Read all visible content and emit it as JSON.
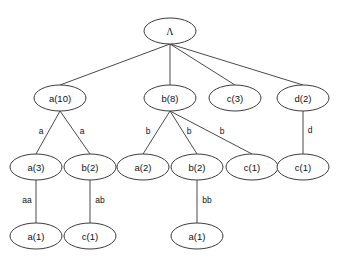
{
  "figure": {
    "type": "tree-diagram",
    "title": "",
    "background_color": "#ffffff",
    "node_fill": "#ffffff",
    "node_stroke": "#3c3c3c",
    "edge_stroke": "#4a4a4a",
    "text_color": "#111111"
  },
  "nodes": [
    {
      "id": "root",
      "label": "Λ",
      "cx": 170,
      "cy": 31,
      "rx": 26,
      "ry": 13,
      "level": 0
    },
    {
      "id": "n-a10",
      "label": "a(10)",
      "cx": 60,
      "cy": 98,
      "rx": 26,
      "ry": 13,
      "level": 1
    },
    {
      "id": "n-b8",
      "label": "b(8)",
      "cx": 170,
      "cy": 98,
      "rx": 26,
      "ry": 13,
      "level": 1
    },
    {
      "id": "n-c3",
      "label": "c(3)",
      "cx": 235,
      "cy": 98,
      "rx": 26,
      "ry": 13,
      "level": 1
    },
    {
      "id": "n-d2",
      "label": "d(2)",
      "cx": 303,
      "cy": 98,
      "rx": 26,
      "ry": 13,
      "level": 1
    },
    {
      "id": "n-a3",
      "label": "a(3)",
      "cx": 36,
      "cy": 167,
      "rx": 26,
      "ry": 13,
      "level": 2
    },
    {
      "id": "n-b2l",
      "label": "b(2)",
      "cx": 90,
      "cy": 167,
      "rx": 26,
      "ry": 13,
      "level": 2
    },
    {
      "id": "n-a2",
      "label": "a(2)",
      "cx": 143,
      "cy": 167,
      "rx": 26,
      "ry": 13,
      "level": 2
    },
    {
      "id": "n-b2m",
      "label": "b(2)",
      "cx": 197,
      "cy": 167,
      "rx": 26,
      "ry": 13,
      "level": 2
    },
    {
      "id": "n-c1m",
      "label": "c(1)",
      "cx": 252,
      "cy": 167,
      "rx": 26,
      "ry": 13,
      "level": 2
    },
    {
      "id": "n-c1r",
      "label": "c(1)",
      "cx": 303,
      "cy": 167,
      "rx": 26,
      "ry": 13,
      "level": 2
    },
    {
      "id": "n-a1l",
      "label": "a(1)",
      "cx": 36,
      "cy": 236,
      "rx": 26,
      "ry": 13,
      "level": 3
    },
    {
      "id": "n-c1l",
      "label": "c(1)",
      "cx": 90,
      "cy": 236,
      "rx": 26,
      "ry": 13,
      "level": 3
    },
    {
      "id": "n-a1m",
      "label": "a(1)",
      "cx": 197,
      "cy": 236,
      "rx": 26,
      "ry": 13,
      "level": 3
    }
  ],
  "edges": [
    {
      "id": "e-root-a10",
      "from": "root",
      "to": "n-a10",
      "x1": 170,
      "y1": 44,
      "x2": 60,
      "y2": 85,
      "label": "",
      "lx": 0,
      "ly": 0
    },
    {
      "id": "e-root-b8",
      "from": "root",
      "to": "n-b8",
      "x1": 170,
      "y1": 44,
      "x2": 170,
      "y2": 85,
      "label": "",
      "lx": 0,
      "ly": 0
    },
    {
      "id": "e-root-c3",
      "from": "root",
      "to": "n-c3",
      "x1": 170,
      "y1": 44,
      "x2": 235,
      "y2": 85,
      "label": "",
      "lx": 0,
      "ly": 0
    },
    {
      "id": "e-root-d2",
      "from": "root",
      "to": "n-d2",
      "x1": 170,
      "y1": 44,
      "x2": 303,
      "y2": 85,
      "label": "",
      "lx": 0,
      "ly": 0
    },
    {
      "id": "e-a10-a3",
      "from": "n-a10",
      "to": "n-a3",
      "x1": 60,
      "y1": 111,
      "x2": 36,
      "y2": 154,
      "label": "a",
      "lx": 41,
      "ly": 131
    },
    {
      "id": "e-a10-b2",
      "from": "n-a10",
      "to": "n-b2l",
      "x1": 60,
      "y1": 111,
      "x2": 90,
      "y2": 154,
      "label": "a",
      "lx": 82,
      "ly": 131
    },
    {
      "id": "e-b8-a2",
      "from": "n-b8",
      "to": "n-a2",
      "x1": 170,
      "y1": 111,
      "x2": 143,
      "y2": 154,
      "label": "b",
      "lx": 148,
      "ly": 131
    },
    {
      "id": "e-b8-b2",
      "from": "n-b8",
      "to": "n-b2m",
      "x1": 170,
      "y1": 111,
      "x2": 197,
      "y2": 154,
      "label": "b",
      "lx": 189,
      "ly": 131
    },
    {
      "id": "e-b8-c1",
      "from": "n-b8",
      "to": "n-c1m",
      "x1": 170,
      "y1": 111,
      "x2": 252,
      "y2": 154,
      "label": "b",
      "lx": 222,
      "ly": 131
    },
    {
      "id": "e-d2-c1",
      "from": "n-d2",
      "to": "n-c1r",
      "x1": 303,
      "y1": 111,
      "x2": 303,
      "y2": 154,
      "label": "d",
      "lx": 310,
      "ly": 130
    },
    {
      "id": "e-a3-a1",
      "from": "n-a3",
      "to": "n-a1l",
      "x1": 36,
      "y1": 180,
      "x2": 36,
      "y2": 223,
      "label": "aa",
      "lx": 27,
      "ly": 200
    },
    {
      "id": "e-b2-c1",
      "from": "n-b2l",
      "to": "n-c1l",
      "x1": 90,
      "y1": 180,
      "x2": 90,
      "y2": 223,
      "label": "ab",
      "lx": 100,
      "ly": 200
    },
    {
      "id": "e-b2m-a1",
      "from": "n-b2m",
      "to": "n-a1m",
      "x1": 197,
      "y1": 180,
      "x2": 197,
      "y2": 223,
      "label": "bb",
      "lx": 207,
      "ly": 200
    }
  ]
}
